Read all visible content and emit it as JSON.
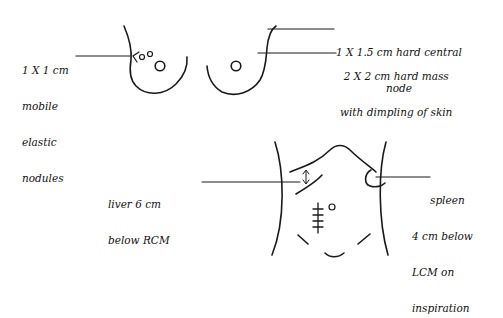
{
  "diagram": {
    "type": "clinical-examination-sketch",
    "line_color": "#1a1a1a",
    "background": "#ffffff",
    "breast_exam": {
      "left_annotation": {
        "lines": [
          "1 X 1 cm",
          "mobile",
          "elastic",
          "nodules"
        ]
      },
      "right_annotation_top": {
        "lines": [
          "1 X 1.5 cm hard central",
          "node"
        ]
      },
      "right_annotation_bottom": {
        "lines": [
          "2 X 2 cm hard mass",
          "with dimpling of skin"
        ]
      }
    },
    "abdomen_exam": {
      "liver_annotation": {
        "lines": [
          "liver 6 cm",
          "below RCM"
        ]
      },
      "spleen_annotation": {
        "lines": [
          "spleen",
          "4 cm below",
          "LCM on",
          "inspiration"
        ]
      }
    }
  }
}
